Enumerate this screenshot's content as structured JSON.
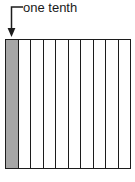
{
  "figure": {
    "title": "",
    "annotation": {
      "label": "one tenth",
      "arrow_direction": "down",
      "points_to": "first-column"
    },
    "diagram": {
      "type": "subdivided-rectangle",
      "total_parts": 10,
      "shaded_parts": 1,
      "fraction": "1/10",
      "shaded_indices": [
        0
      ],
      "fill_color": "#a6a6a6",
      "unshaded_color": "#ffffff",
      "outline_color": "#1c1c1c"
    },
    "cells": [
      {
        "index": 1,
        "shaded": true
      },
      {
        "index": 2,
        "shaded": false
      },
      {
        "index": 3,
        "shaded": false
      },
      {
        "index": 4,
        "shaded": false
      },
      {
        "index": 5,
        "shaded": false
      },
      {
        "index": 6,
        "shaded": false
      },
      {
        "index": 7,
        "shaded": false
      },
      {
        "index": 8,
        "shaded": false
      },
      {
        "index": 9,
        "shaded": false
      },
      {
        "index": 10,
        "shaded": false
      }
    ]
  }
}
